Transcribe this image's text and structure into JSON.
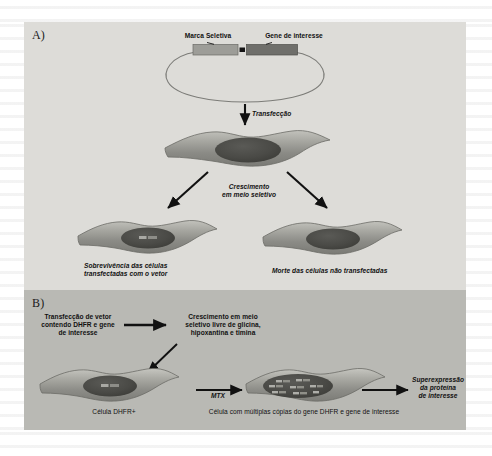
{
  "figure": {
    "panels": [
      {
        "id": "A",
        "label": "A)"
      },
      {
        "id": "B",
        "label": "B)"
      }
    ]
  },
  "panel_a": {
    "plasmid": {
      "marker_gene_label": "Marca Seletiva",
      "gene_of_interest_label": "Gene de interesse"
    },
    "step_transfection": "Transfecção",
    "step_growth": "Crescimento\nem meio seletivo",
    "outcome_left": "Sobrevivência das células\ntransfectadas com o vetor",
    "outcome_right": "Morte das células não transfectadas"
  },
  "panel_b": {
    "step_transfection": "Transfecção de vetor\ncontendo DHFR e gene\nde interesse",
    "step_selective_medium": "Crescimento em meio\nseletivo livre de glicina,\nhipoxantina e timina",
    "cell_left_caption": "Célula DHFR+",
    "arrow_label_mtx": "MTX",
    "cell_right_caption": "Célula com múltiplas cópias do gene DHFR e gene de interesse",
    "outcome": "Superexpressão\nda proteína\nde interesse"
  },
  "colors": {
    "panel_a_bg": "#dddcd8",
    "panel_b_bg": "#b9b9b4",
    "cell_body_light": "#b4b4ae",
    "cell_body_dark": "#7d7d78",
    "nucleus": "#4a4a46",
    "gene_marker_light": "#9a9a96",
    "gene_marker_dark": "#6e6e6a",
    "ink": "#111111"
  }
}
